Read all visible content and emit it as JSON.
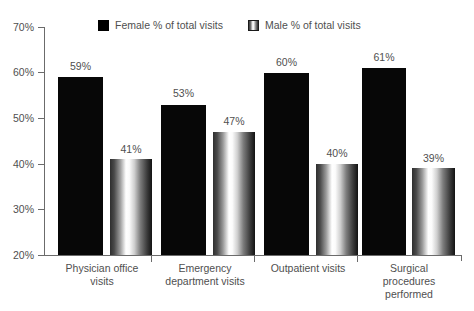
{
  "chart_data": {
    "type": "bar",
    "title": "",
    "xlabel": "",
    "ylabel": "",
    "ylim": [
      20,
      70
    ],
    "ytick_labels": [
      "70%",
      "60%",
      "50%",
      "40%",
      "30%",
      "20%"
    ],
    "ytick_values": [
      70,
      60,
      50,
      40,
      30,
      20
    ],
    "grid": false,
    "legend_position": "top",
    "categories": [
      "Physician office\nvisits",
      "Emergency\ndepartment visits",
      "Outpatient visits",
      "Surgical\nprocedures\nperformed"
    ],
    "series": [
      {
        "name": "Female % of total visits",
        "color": "#070707",
        "values": [
          59,
          53,
          60,
          61
        ],
        "labels": [
          "59%",
          "53%",
          "60%",
          "61%"
        ]
      },
      {
        "name": "Male % of total visits",
        "color": "#9a9a9a",
        "values": [
          41,
          47,
          40,
          39
        ],
        "labels": [
          "41%",
          "47%",
          "40%",
          "39%"
        ]
      }
    ]
  },
  "legend": {
    "female_label": "Female % of total visits",
    "male_label": "Male % of total visits"
  },
  "axis": {
    "tick_70": "70%",
    "tick_60": "60%",
    "tick_50": "50%",
    "tick_40": "40%",
    "tick_30": "30%",
    "tick_20": "20%"
  },
  "groups": [
    {
      "label": "Physician office\nvisits",
      "female_label": "59%",
      "male_label": "41%"
    },
    {
      "label": "Emergency\ndepartment visits",
      "female_label": "53%",
      "male_label": "47%"
    },
    {
      "label": "Outpatient visits",
      "female_label": "60%",
      "male_label": "40%"
    },
    {
      "label": "Surgical\nprocedures\nperformed",
      "female_label": "39%",
      "male_label": "39%"
    }
  ]
}
